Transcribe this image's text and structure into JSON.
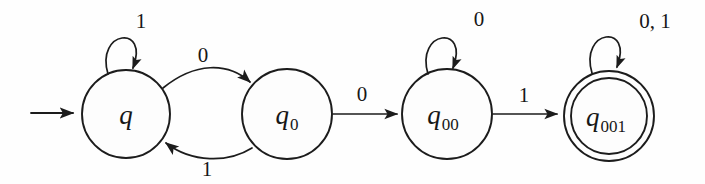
{
  "figure": {
    "kind": "finite-state-automaton",
    "caption": "",
    "background_color": "#fefefe",
    "stroke_color": "#1c1c1c"
  },
  "diagram": {
    "start_marker": {
      "name": "start-arrow",
      "target_state": "q",
      "label": ""
    },
    "states": [
      {
        "id": "q",
        "base": "q",
        "subscript": "",
        "accepting": false,
        "cx": 126,
        "cy": 114,
        "r": 44
      },
      {
        "id": "q0",
        "base": "q",
        "subscript": "0",
        "accepting": false,
        "cx": 287,
        "cy": 114,
        "r": 45
      },
      {
        "id": "q00",
        "base": "q",
        "subscript": "00",
        "accepting": false,
        "cx": 447,
        "cy": 114,
        "r": 45
      },
      {
        "id": "q001",
        "base": "q",
        "subscript": "001",
        "accepting": true,
        "cx": 609,
        "cy": 116,
        "r": 45,
        "r_inner": 38
      }
    ],
    "transitions": [
      {
        "name": "loop-q-on-1",
        "from": "q",
        "to": "q",
        "label": "1",
        "label_x": 141,
        "label_y": 28,
        "kind": "self-loop"
      },
      {
        "name": "edge-q-to-q0-on-0",
        "from": "q",
        "to": "q0",
        "label": "0",
        "label_x": 203,
        "label_y": 62,
        "kind": "curve-upper"
      },
      {
        "name": "edge-q0-to-q-on-1",
        "from": "q0",
        "to": "q",
        "label": "1",
        "label_x": 207,
        "label_y": 176,
        "kind": "curve-lower"
      },
      {
        "name": "edge-q0-to-q00-on-0",
        "from": "q0",
        "to": "q00",
        "label": "0",
        "label_x": 362,
        "label_y": 101,
        "kind": "straight"
      },
      {
        "name": "loop-q00-on-0",
        "from": "q00",
        "to": "q00",
        "label": "0",
        "label_x": 479,
        "label_y": 26,
        "kind": "self-loop"
      },
      {
        "name": "edge-q00-to-q001-on-1",
        "from": "q00",
        "to": "q001",
        "label": "1",
        "label_x": 524,
        "label_y": 102,
        "kind": "straight"
      },
      {
        "name": "loop-q001-on-0-1",
        "from": "q001",
        "to": "q001",
        "label": "0, 1",
        "label_x": 655,
        "label_y": 28,
        "kind": "self-loop"
      }
    ],
    "alphabet": [
      "0",
      "1"
    ],
    "start_state": "q",
    "accepting_states": [
      "q001"
    ]
  }
}
